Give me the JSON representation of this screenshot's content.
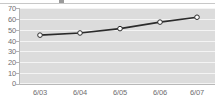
{
  "chart_data": {
    "type": "line",
    "title": "",
    "subtitle": "",
    "xlabel": "",
    "ylabel": "",
    "categories": [
      "6/03",
      "6/04",
      "6/05",
      "6/06",
      "6/07"
    ],
    "values": [
      45,
      47,
      51,
      57,
      61.5
    ],
    "series": [
      {
        "name": "series-1",
        "values": [
          45,
          47,
          51,
          57,
          61.5
        ]
      }
    ],
    "ylim": [
      0,
      70
    ],
    "y_ticks": [
      0,
      10,
      20,
      30,
      40,
      50,
      60,
      70
    ],
    "y_tick_labels": [
      "0",
      "10",
      "20",
      "30",
      "40",
      "50",
      "60",
      "70"
    ],
    "x_tick_labels": [
      "6/03",
      "6/04",
      "6/05",
      "6/06",
      "6/07"
    ],
    "grid": true,
    "grid_axis": "y",
    "legend": false,
    "legend_position": "none",
    "marker": "circle-open",
    "colors": {
      "line": "#2b2b2b",
      "marker_fill": "#ffffff",
      "marker_stroke": "#2b2b2b",
      "plot_background": "#dcdcdc",
      "gridline": "#f4f4f4",
      "axis": "#b8b8b8",
      "tick_label": "#6f6f6f",
      "page_background": "#ffffff"
    }
  }
}
